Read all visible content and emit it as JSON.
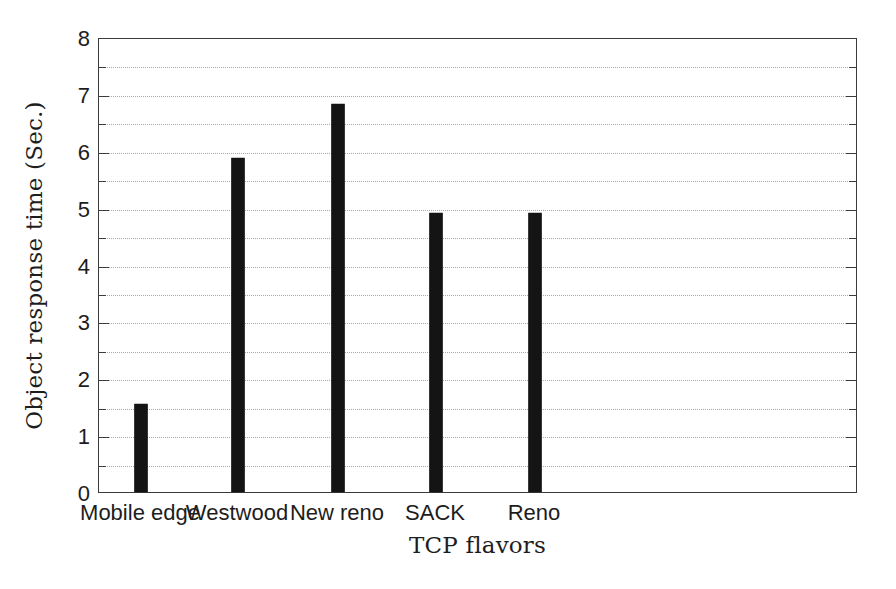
{
  "chart_data": {
    "type": "bar",
    "title": "",
    "subtitle": "",
    "xlabel": "TCP flavors",
    "ylabel": "Object response time (Sec.)",
    "categories": [
      "Mobile edge",
      "Westwood",
      "New reno",
      "SACK",
      "Reno"
    ],
    "values": [
      1.55,
      5.87,
      6.82,
      4.9,
      4.9
    ],
    "series": [
      {
        "name": "Object response time",
        "values": [
          1.55,
          5.87,
          6.82,
          4.9,
          4.9
        ]
      }
    ],
    "ylim": [
      0,
      8
    ],
    "ytick_labels": [
      "0",
      "1",
      "2",
      "3",
      "4",
      "5",
      "6",
      "7",
      "8"
    ],
    "ytick_values": [
      0,
      1,
      2,
      3,
      4,
      5,
      6,
      7,
      8
    ],
    "minor_tick_step": 0.5,
    "grid": true,
    "grid_axis": "y",
    "grid_style": "dotted",
    "legend": false,
    "legend_position": "none",
    "bar_color": "#141414",
    "grid_color": "#a8a8a8",
    "axis_color": "#3b3b3b",
    "background_color": "#ffffff",
    "annotations": []
  }
}
